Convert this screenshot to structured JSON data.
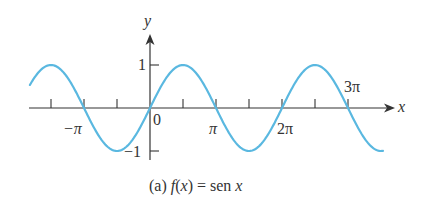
{
  "chart_data": {
    "type": "line",
    "title": "",
    "caption": "(a) f(x) = sen x",
    "function": "sin(x)",
    "xlabel": "x",
    "ylabel": "y",
    "xlim": [
      -1.82,
      3.53
    ],
    "xlim_units": "pi",
    "ylim": [
      -1,
      1
    ],
    "x_tick_labels": [
      "−π",
      "0",
      "π",
      "2π",
      "3π"
    ],
    "y_tick_labels": [
      "1",
      "−1"
    ],
    "x_tick_positions_pi": [
      -1.5,
      -1,
      -0.5,
      0.5,
      1,
      1.5,
      2,
      2.5,
      3
    ],
    "series": [
      {
        "name": "f(x) = sen x",
        "color": "#5ab8e0"
      }
    ],
    "grid": false,
    "legend": "none"
  },
  "labels": {
    "y_axis": "y",
    "x_axis": "x",
    "y_one": "1",
    "y_neg_one": "−1",
    "origin": "0",
    "neg_pi": "−π",
    "pi": "π",
    "two_pi": "2π",
    "three_pi": "3π",
    "caption_prefix": "(a) ",
    "caption_fx": "f",
    "caption_mid": "(",
    "caption_x": "x",
    "caption_end": ") = sen ",
    "caption_x2": "x"
  }
}
